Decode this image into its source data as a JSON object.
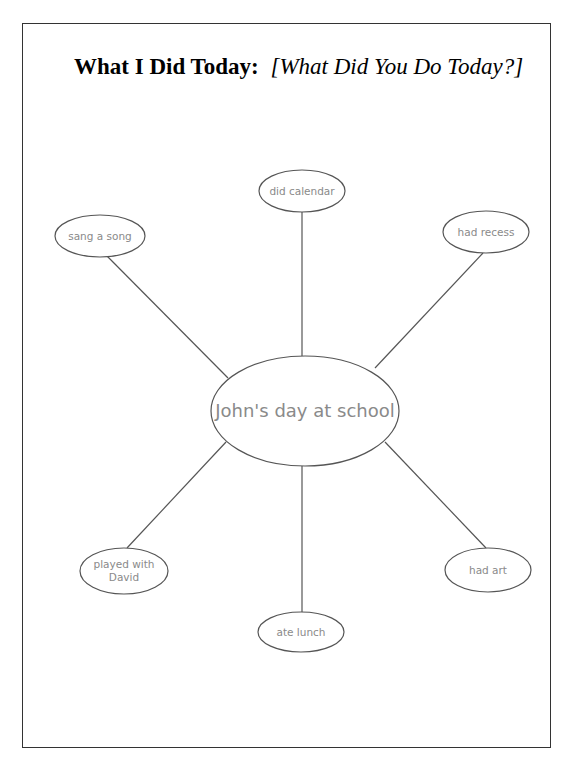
{
  "title": {
    "bold": "What I Did Today:",
    "italic": "[What Did You Do Today?]"
  },
  "web": {
    "stroke_color": "#555555",
    "text_color": "#8a8a8a",
    "center": {
      "label": "John's day at school",
      "cx": 305,
      "cy": 411,
      "rx": 94,
      "ry": 55
    },
    "nodes": [
      {
        "id": "did-calendar",
        "label": "did calendar",
        "cx": 302,
        "cy": 191,
        "rx": 43,
        "ry": 21
      },
      {
        "id": "sang-a-song",
        "label": "sang a song",
        "cx": 100,
        "cy": 236,
        "rx": 45,
        "ry": 21
      },
      {
        "id": "had-recess",
        "label": "had recess",
        "cx": 486,
        "cy": 232,
        "rx": 43,
        "ry": 21
      },
      {
        "id": "played-with-david",
        "label": "played with\nDavid",
        "line1": "played with",
        "line2": "David",
        "cx": 124,
        "cy": 571,
        "rx": 44,
        "ry": 23
      },
      {
        "id": "had-art",
        "label": "had art",
        "cx": 488,
        "cy": 570,
        "rx": 43,
        "ry": 22
      },
      {
        "id": "ate-lunch",
        "label": "ate lunch",
        "cx": 301,
        "cy": 632,
        "rx": 43,
        "ry": 20
      }
    ],
    "connectors": [
      {
        "to": "did-calendar",
        "x1": 302,
        "y1": 356,
        "x2": 302,
        "y2": 212
      },
      {
        "to": "sang-a-song",
        "x1": 228,
        "y1": 378,
        "x2": 107,
        "y2": 256
      },
      {
        "to": "had-recess",
        "x1": 375,
        "y1": 368,
        "x2": 483,
        "y2": 253
      },
      {
        "to": "played-with-david",
        "x1": 226,
        "y1": 442,
        "x2": 127,
        "y2": 548
      },
      {
        "to": "had-art",
        "x1": 385,
        "y1": 442,
        "x2": 486,
        "y2": 548
      },
      {
        "to": "ate-lunch",
        "x1": 302,
        "y1": 466,
        "x2": 302,
        "y2": 612
      }
    ]
  }
}
